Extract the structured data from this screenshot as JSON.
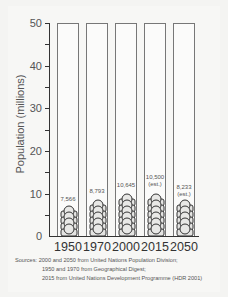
{
  "chart_data": {
    "type": "bar",
    "title": "",
    "xlabel": "",
    "ylabel": "Population (millions)",
    "ylim": [
      0,
      50
    ],
    "yticks": [
      0,
      10,
      20,
      30,
      40,
      50
    ],
    "categories": [
      "1950",
      "1970",
      "2000",
      "2015",
      "2050"
    ],
    "values": [
      7.566,
      8.793,
      10.645,
      10.5,
      8.233
    ],
    "value_labels": [
      "7,566",
      "8,793",
      "10,645",
      "10,500",
      "8,233"
    ],
    "value_notes": [
      "",
      "",
      "",
      "(est.)",
      "(est.)"
    ],
    "grid": false,
    "legend": null,
    "style": "pictogram columns of stacked person icons inside empty column outlines"
  },
  "axis": {
    "ylabel": "Population (millions)",
    "ticks": [
      "50",
      "40",
      "30",
      "20",
      "10",
      "0"
    ]
  },
  "bars": [
    {
      "year": "1950",
      "label": "7,566",
      "note": ""
    },
    {
      "year": "1970",
      "label": "8,793",
      "note": ""
    },
    {
      "year": "2000",
      "label": "10,645",
      "note": ""
    },
    {
      "year": "2015",
      "label": "10,500",
      "note": "(est.)"
    },
    {
      "year": "2050",
      "label": "8,233",
      "note": "(est.)"
    }
  ],
  "sources": {
    "line1": "Sources: 2000 and 2050 from United Nations Population Division;",
    "line2": "1950 and 1970 from Geographical Digest;",
    "line3": "2015 from United Nations Development Programme (HDR 2001)"
  }
}
